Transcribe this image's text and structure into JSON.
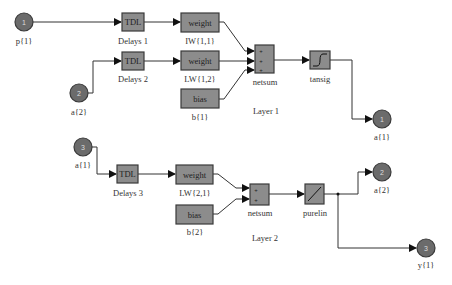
{
  "diagram": {
    "layer1": {
      "title": "Layer 1",
      "inputs": [
        {
          "number": "1",
          "label": "p{1}"
        },
        {
          "number": "2",
          "label": "a{2}"
        }
      ],
      "delays": [
        {
          "text": "TDL",
          "label": "Delays 1"
        },
        {
          "text": "TDL",
          "label": "Delays 2"
        }
      ],
      "weights": [
        {
          "text": "weight",
          "label": "IW{1,1}"
        },
        {
          "text": "weight",
          "label": "LW{1,2}"
        }
      ],
      "bias": {
        "text": "bias",
        "label": "b{1}"
      },
      "sum": {
        "label": "netsum",
        "signs": [
          "+",
          "+",
          "+"
        ]
      },
      "transfer": {
        "label": "tansig",
        "icon": "tansig-icon"
      },
      "output": {
        "number": "1",
        "label": "a{1}"
      }
    },
    "layer2": {
      "title": "Layer 2",
      "input": {
        "number": "3",
        "label": "a{1}"
      },
      "delay": {
        "text": "TDL",
        "label": "Delays 3"
      },
      "weight": {
        "text": "weight",
        "label": "LW{2,1}"
      },
      "bias": {
        "text": "bias",
        "label": "b{2}"
      },
      "sum": {
        "label": "netsum",
        "signs": [
          "+",
          "+"
        ]
      },
      "transfer": {
        "label": "purelin",
        "icon": "purelin-icon"
      },
      "outputs": [
        {
          "number": "2",
          "label": "a{2}"
        },
        {
          "number": "3",
          "label": "y{1}"
        }
      ]
    },
    "colors": {
      "block": "#8c8c8c",
      "port": "#6b6b6b",
      "wire": "#333333"
    }
  }
}
